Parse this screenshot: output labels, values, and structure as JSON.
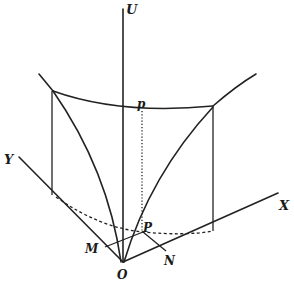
{
  "figure": {
    "type": "3D coordinate geometry diagram (surface over XY plane)",
    "labels": {
      "U": "U",
      "X": "X",
      "Y": "Y",
      "O": "O",
      "M": "M",
      "N": "N",
      "P": "P",
      "p": "p"
    }
  }
}
